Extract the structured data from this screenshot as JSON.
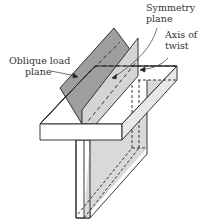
{
  "figure": {
    "labels": {
      "symmetry_plane": [
        "Symmetry",
        "plane"
      ],
      "axis_of_twist": [
        "Axis of",
        "twist"
      ],
      "oblique_load_plane": [
        "Oblique load",
        "plane"
      ]
    },
    "colors": {
      "line": "#222222",
      "oblique_plane_fill": "#9e9e9e",
      "symmetry_plane_fill": "#d4d4d4",
      "web_fill": "#d9d9d9",
      "flange_fill": "#ffffff",
      "text": "#333333"
    }
  }
}
